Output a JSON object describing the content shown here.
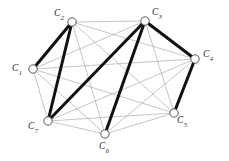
{
  "figure": {
    "title": "",
    "background_color": "#ffffff",
    "width": 229,
    "height": 161
  },
  "style": {
    "thin_edge_color": "#a0a0a0",
    "thin_edge_width": 0.6,
    "bold_edge_color": "#111111",
    "bold_edge_width": 3.0,
    "node_fill": "#ffffff",
    "node_stroke": "#4a4a4a",
    "node_radius": 4.2,
    "label_color": "#2b2b2b"
  },
  "chart_data": {
    "type": "diagram",
    "subtype": "node-link-graph",
    "title": "",
    "xlabel": "",
    "ylabel": "",
    "node_count": 7,
    "edge_count_thin": 21,
    "edge_count_bold": 6,
    "nodes": [
      {
        "id": "C1",
        "label": "C",
        "sub": "1",
        "x": 33,
        "y": 69,
        "label_x": 12,
        "label_y": 64
      },
      {
        "id": "C2",
        "label": "C",
        "sub": "2",
        "x": 72,
        "y": 22,
        "label_x": 54,
        "label_y": 9
      },
      {
        "id": "C3",
        "label": "C",
        "sub": "3",
        "x": 145,
        "y": 21,
        "label_x": 152,
        "label_y": 8
      },
      {
        "id": "C4",
        "label": "C",
        "sub": "4",
        "x": 195,
        "y": 59,
        "label_x": 203,
        "label_y": 50
      },
      {
        "id": "C5",
        "label": "C",
        "sub": "5",
        "x": 174,
        "y": 113,
        "label_x": 177,
        "label_y": 116
      },
      {
        "id": "C6",
        "label": "C",
        "sub": "6",
        "x": 105,
        "y": 134,
        "label_x": 99,
        "label_y": 142
      },
      {
        "id": "C7",
        "label": "C",
        "sub": "7",
        "x": 48,
        "y": 121,
        "label_x": 28,
        "label_y": 122
      }
    ],
    "thin_edges": [
      [
        "C1",
        "C2"
      ],
      [
        "C1",
        "C3"
      ],
      [
        "C1",
        "C4"
      ],
      [
        "C1",
        "C5"
      ],
      [
        "C1",
        "C6"
      ],
      [
        "C1",
        "C7"
      ],
      [
        "C2",
        "C3"
      ],
      [
        "C2",
        "C4"
      ],
      [
        "C2",
        "C5"
      ],
      [
        "C2",
        "C6"
      ],
      [
        "C2",
        "C7"
      ],
      [
        "C3",
        "C4"
      ],
      [
        "C3",
        "C5"
      ],
      [
        "C3",
        "C6"
      ],
      [
        "C3",
        "C7"
      ],
      [
        "C4",
        "C5"
      ],
      [
        "C4",
        "C6"
      ],
      [
        "C4",
        "C7"
      ],
      [
        "C5",
        "C6"
      ],
      [
        "C5",
        "C7"
      ],
      [
        "C6",
        "C7"
      ]
    ],
    "bold_edges": [
      [
        "C1",
        "C2"
      ],
      [
        "C2",
        "C7"
      ],
      [
        "C3",
        "C7"
      ],
      [
        "C3",
        "C6"
      ],
      [
        "C3",
        "C4"
      ],
      [
        "C4",
        "C5"
      ]
    ]
  }
}
